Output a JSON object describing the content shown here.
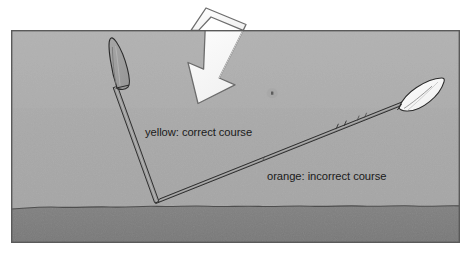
{
  "figure": {
    "title_visible": false,
    "frame": {
      "x": 11,
      "y": 30,
      "width": 449,
      "height": 213,
      "border_color": "#5a5a5a",
      "border_width": 1.4
    },
    "background": {
      "sky_color": "#a9a9a9",
      "sky_top_color": "#b0b0b0",
      "ground_color": "#7d7d7d",
      "ground_top_y": 206,
      "page_color": "#ffffff"
    }
  },
  "labels": [
    {
      "id": "yellow-course",
      "text": "yellow: correct course",
      "x": 145,
      "y": 136,
      "color": "#1a1a1a"
    },
    {
      "id": "orange-course",
      "text": "orange: incorrect course",
      "x": 267,
      "y": 180,
      "color": "#1a1a1a"
    }
  ],
  "tools": [
    {
      "id": "yellow-spade",
      "course": "correct",
      "color_name": "yellow",
      "blade_fill": "#9d9d9d",
      "shaft_fill": "#9b9b9b",
      "outline": "#2b2b2b",
      "tip": {
        "x": 157,
        "y": 202
      },
      "head": {
        "x": 112,
        "y": 62
      },
      "angle_deg": 69
    },
    {
      "id": "orange-spade",
      "course": "incorrect",
      "color_name": "orange",
      "blade_fill": "#fdfdfd",
      "shaft_fill": "#8a8a8a",
      "outline": "#2b2b2b",
      "tip": {
        "x": 157,
        "y": 202
      },
      "head": {
        "x": 424,
        "y": 90
      },
      "angle_deg": 24
    }
  ],
  "arrow": {
    "id": "force-arrow",
    "direction": "down-right",
    "fill": "#fbfbfb",
    "outline": "#6f6f6f",
    "tilt_deg": 18,
    "x": 175,
    "y": 6,
    "width": 72,
    "height": 98
  },
  "speck": {
    "id": "ground-speck",
    "x": 272,
    "y": 93,
    "size": 2.4,
    "color": "#3a3a3a"
  },
  "colors": {
    "outline": "#2b2b2b",
    "sky": "#a9a9a9",
    "ground": "#7d7d7d",
    "white": "#fdfdfd",
    "text": "#1a1a1a"
  }
}
